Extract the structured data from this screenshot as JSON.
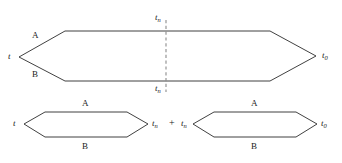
{
  "figure": {
    "stroke_color": "#2b2b2b",
    "dashed_color": "#8c8c8c",
    "background": "#ffffff",
    "operator": "+",
    "top_shape": {
      "name": "combined-hexagon",
      "left_label": "t",
      "right_label": "t",
      "right_label_sub": "0",
      "split_top_label": "t",
      "split_top_label_sub": "n",
      "split_bottom_label": "t",
      "split_bottom_label_sub": "n",
      "upper_path_label": "A",
      "lower_path_label": "B"
    },
    "left_shape": {
      "name": "first-hexagon",
      "left_label": "t",
      "right_label": "t",
      "right_label_sub": "n",
      "upper_path_label": "A",
      "lower_path_label": "B"
    },
    "right_shape": {
      "name": "second-hexagon",
      "left_label": "t",
      "left_label_sub": "n",
      "right_label": "t",
      "right_label_sub": "0",
      "upper_path_label": "A",
      "lower_path_label": "B"
    }
  }
}
